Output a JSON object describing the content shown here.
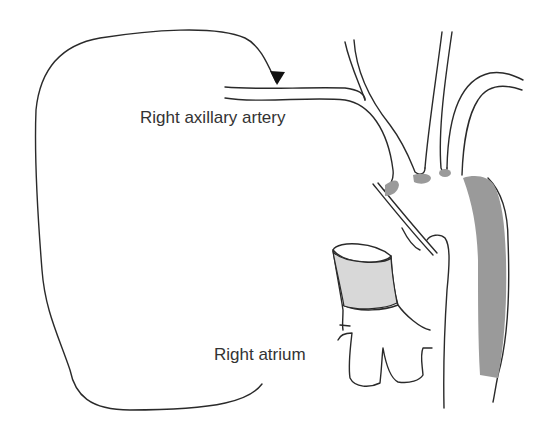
{
  "diagram": {
    "labels": {
      "axillary": "Right axillary artery",
      "atrium": "Right atrium"
    },
    "colors": {
      "line": "#2a2a2a",
      "shade_dark": "#9a9a9a",
      "shade_light": "#d8d8d8",
      "background": "#ffffff"
    }
  }
}
